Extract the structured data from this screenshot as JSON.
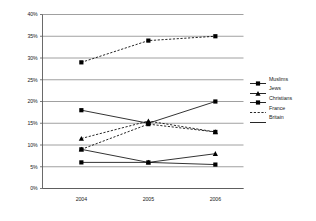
{
  "chart_data": {
    "type": "line",
    "title": "",
    "subtitle": "",
    "xlabel": "",
    "ylabel": "",
    "categories": [
      "2004",
      "2005",
      "2006"
    ],
    "x": [
      2004,
      2005,
      2006
    ],
    "ylim": [
      0,
      40
    ],
    "ytick_values": [
      0,
      5,
      10,
      15,
      20,
      25,
      30,
      35,
      40
    ],
    "ytick_labels": [
      "0%",
      "5%",
      "10%",
      "15%",
      "20%",
      "25%",
      "30%",
      "35%",
      "40%"
    ],
    "grid": "horizontal",
    "legend_position": "right",
    "series": [
      {
        "name": "France - Muslims",
        "country": "France",
        "group": "Muslims",
        "style": "dashed",
        "marker": "square",
        "color": "#000000",
        "values": [
          29,
          34,
          35
        ]
      },
      {
        "name": "Britain - Muslims",
        "country": "Britain",
        "group": "Muslims",
        "style": "solid",
        "marker": "square",
        "color": "#000000",
        "values": [
          18,
          15,
          20
        ]
      },
      {
        "name": "France - Jews",
        "country": "France",
        "group": "Jews",
        "style": "dashed",
        "marker": "triangle",
        "color": "#000000",
        "values": [
          11.5,
          15.5,
          13
        ]
      },
      {
        "name": "France - Christians",
        "country": "France",
        "group": "Christians",
        "style": "dashed",
        "marker": "square",
        "color": "#000000",
        "values": [
          9,
          14.8,
          13
        ]
      },
      {
        "name": "Britain - Jews",
        "country": "Britain",
        "group": "Jews",
        "style": "solid",
        "marker": "triangle",
        "color": "#000000",
        "values": [
          9,
          6,
          8
        ]
      },
      {
        "name": "Britain - Christians",
        "country": "Britain",
        "group": "Christians",
        "style": "solid",
        "marker": "square",
        "color": "#000000",
        "values": [
          6,
          6,
          5.5
        ]
      }
    ]
  },
  "legend": {
    "items": [
      {
        "label": "Muslims",
        "marker": "square",
        "style": "solid"
      },
      {
        "label": "Jews",
        "marker": "triangle",
        "style": "solid"
      },
      {
        "label": "Christians",
        "marker": "square",
        "style": "solid"
      },
      {
        "label": "France",
        "marker": "none",
        "style": "dashed"
      },
      {
        "label": "Britain",
        "marker": "none",
        "style": "solid"
      }
    ]
  },
  "axes": {
    "y_labels": [
      "40%",
      "35%",
      "30%",
      "25%",
      "20%",
      "15%",
      "10%",
      "5%",
      "0%"
    ],
    "x_labels": [
      "2004",
      "2005",
      "2006"
    ]
  },
  "colors": {
    "line": "#000000",
    "grid": "#808080",
    "axis": "#595959",
    "text": "#1a1a1a",
    "background": "#ffffff"
  }
}
